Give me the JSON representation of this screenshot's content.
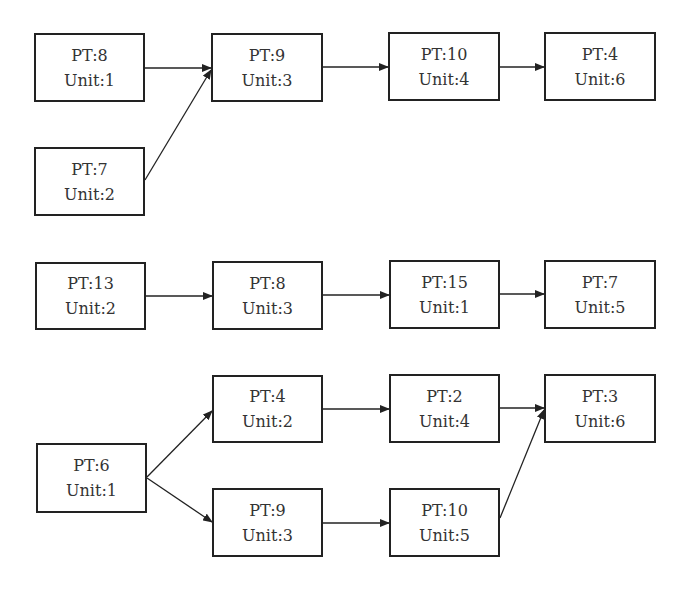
{
  "diagram": {
    "groups": [
      {
        "nodes": [
          {
            "id": "g1n1",
            "pt": "PT:8",
            "unit": "Unit:1",
            "box": [
              34,
              33,
              111,
              69
            ]
          },
          {
            "id": "g1n2",
            "pt": "PT:7",
            "unit": "Unit:2",
            "box": [
              34,
              147,
              111,
              69
            ]
          },
          {
            "id": "g1n3",
            "pt": "PT:9",
            "unit": "Unit:3",
            "box": [
              211,
              33,
              112,
              69
            ]
          },
          {
            "id": "g1n4",
            "pt": "PT:10",
            "unit": "Unit:4",
            "box": [
              388,
              32,
              112,
              69
            ]
          },
          {
            "id": "g1n5",
            "pt": "PT:4",
            "unit": "Unit:6",
            "box": [
              544,
              32,
              112,
              69
            ]
          }
        ],
        "edges": [
          {
            "from": "PT:8 Unit:1",
            "to": "PT:9 Unit:3",
            "line": [
              145,
              68,
              211,
              68
            ]
          },
          {
            "from": "PT:7 Unit:2",
            "to": "PT:9 Unit:3",
            "line": [
              145,
              180,
              211,
              70
            ]
          },
          {
            "from": "PT:9 Unit:3",
            "to": "PT:10 Unit:4",
            "line": [
              323,
              67,
              388,
              67
            ]
          },
          {
            "from": "PT:10 Unit:4",
            "to": "PT:4 Unit:6",
            "line": [
              500,
              67,
              544,
              67
            ]
          }
        ]
      },
      {
        "nodes": [
          {
            "id": "g2n1",
            "pt": "PT:13",
            "unit": "Unit:2",
            "box": [
              35,
              262,
              111,
              68
            ]
          },
          {
            "id": "g2n2",
            "pt": "PT:8",
            "unit": "Unit:3",
            "box": [
              212,
              261,
              111,
              69
            ]
          },
          {
            "id": "g2n3",
            "pt": "PT:15",
            "unit": "Unit:1",
            "box": [
              389,
              260,
              111,
              69
            ]
          },
          {
            "id": "g2n4",
            "pt": "PT:7",
            "unit": "Unit:5",
            "box": [
              544,
              260,
              112,
              69
            ]
          }
        ],
        "edges": [
          {
            "from": "PT:13 Unit:2",
            "to": "PT:8 Unit:3",
            "line": [
              146,
              296,
              212,
              296
            ]
          },
          {
            "from": "PT:8 Unit:3",
            "to": "PT:15 Unit:1",
            "line": [
              323,
              295,
              389,
              295
            ]
          },
          {
            "from": "PT:15 Unit:1",
            "to": "PT:7 Unit:5",
            "line": [
              500,
              294,
              544,
              294
            ]
          }
        ]
      },
      {
        "nodes": [
          {
            "id": "g3n1",
            "pt": "PT:6",
            "unit": "Unit:1",
            "box": [
              36,
              443,
              111,
              70
            ]
          },
          {
            "id": "g3n2",
            "pt": "PT:4",
            "unit": "Unit:2",
            "box": [
              212,
              375,
              111,
              68
            ]
          },
          {
            "id": "g3n3",
            "pt": "PT:9",
            "unit": "Unit:3",
            "box": [
              212,
              488,
              111,
              69
            ]
          },
          {
            "id": "g3n4",
            "pt": "PT:2",
            "unit": "Unit:4",
            "box": [
              389,
              374,
              111,
              69
            ]
          },
          {
            "id": "g3n5",
            "pt": "PT:10",
            "unit": "Unit:5",
            "box": [
              389,
              488,
              111,
              69
            ]
          },
          {
            "id": "g3n6",
            "pt": "PT:3",
            "unit": "Unit:6",
            "box": [
              544,
              374,
              112,
              69
            ]
          }
        ],
        "edges": [
          {
            "from": "PT:6 Unit:1",
            "to": "PT:4 Unit:2",
            "line": [
              147,
              477,
              212,
              411
            ]
          },
          {
            "from": "PT:6 Unit:1",
            "to": "PT:9 Unit:3",
            "line": [
              147,
              478,
              212,
              522
            ]
          },
          {
            "from": "PT:4 Unit:2",
            "to": "PT:2 Unit:4",
            "line": [
              323,
              409,
              389,
              409
            ]
          },
          {
            "from": "PT:9 Unit:3",
            "to": "PT:10 Unit:5",
            "line": [
              323,
              523,
              389,
              523
            ]
          },
          {
            "from": "PT:2 Unit:4",
            "to": "PT:3 Unit:6",
            "line": [
              500,
              408,
              544,
              408
            ]
          },
          {
            "from": "PT:10 Unit:5",
            "to": "PT:3 Unit:6",
            "line": [
              500,
              518,
              544,
              410
            ]
          }
        ]
      }
    ]
  },
  "colors": {
    "stroke": "#222222",
    "text": "#333333",
    "background": "#ffffff"
  }
}
